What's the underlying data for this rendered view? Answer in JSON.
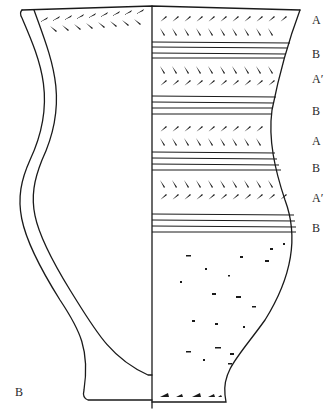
{
  "figure": {
    "label": "B",
    "line_color": "#1a1a1a",
    "background": "#ffffff"
  },
  "zones": [
    {
      "label": "A",
      "y": 14
    },
    {
      "label": "B",
      "y": 48
    },
    {
      "label": "A′",
      "y": 73
    },
    {
      "label": "B",
      "y": 105
    },
    {
      "label": "A",
      "y": 135
    },
    {
      "label": "B",
      "y": 162
    },
    {
      "label": "A′",
      "y": 192
    },
    {
      "label": "B",
      "y": 222
    }
  ]
}
